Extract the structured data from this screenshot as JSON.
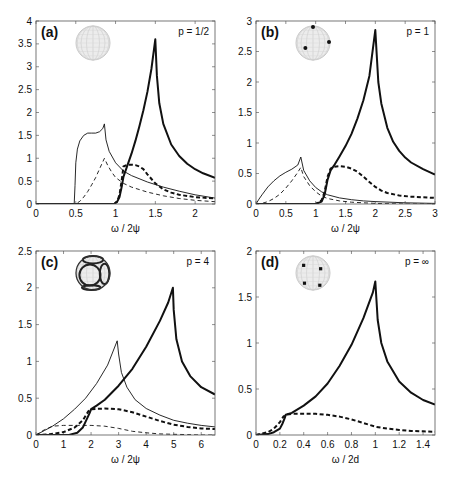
{
  "chart_data": [
    {
      "type": "line",
      "panel": "(a)",
      "annotation": "p = 1/2",
      "xlabel": "ω / 2ψ",
      "ylabel": "",
      "xlim": [
        0,
        2.25
      ],
      "ylim": [
        0,
        4
      ],
      "xticks": [
        0,
        0.5,
        1,
        1.5,
        2
      ],
      "xtick_labels": [
        "0",
        "0.5",
        "1",
        "1.5",
        "2"
      ],
      "yticks": [
        0,
        0.5,
        1,
        1.5,
        2,
        2.5,
        3,
        3.5,
        4
      ],
      "ytick_labels": [
        "0",
        "0.5",
        "1",
        "1.5",
        "2",
        "2.5",
        "3",
        "3.5",
        "4"
      ],
      "inset": "sphere-plain",
      "frame": {
        "x": 36,
        "y": 21,
        "w": 179,
        "h": 183
      },
      "series": [
        {
          "name": "thin-solid",
          "style": "thin-solid",
          "x": [
            0,
            0.48,
            0.49,
            0.5,
            0.52,
            0.55,
            0.6,
            0.65,
            0.7,
            0.75,
            0.8,
            0.84,
            0.86,
            0.88,
            0.92,
            1.0,
            1.1,
            1.2,
            1.4,
            1.6,
            1.8,
            2.0,
            2.25
          ],
          "y": [
            0,
            0,
            0.4,
            0.9,
            1.2,
            1.38,
            1.5,
            1.55,
            1.55,
            1.55,
            1.58,
            1.65,
            1.75,
            1.4,
            1.15,
            0.9,
            0.72,
            0.62,
            0.48,
            0.37,
            0.28,
            0.2,
            0.13
          ]
        },
        {
          "name": "thin-dashed",
          "style": "thin-dashed",
          "x": [
            0,
            0.5,
            0.55,
            0.6,
            0.65,
            0.7,
            0.75,
            0.8,
            0.86,
            0.9,
            0.95,
            1.0,
            1.1,
            1.2,
            1.4,
            1.6,
            1.8,
            2.0,
            2.25
          ],
          "y": [
            0,
            0,
            0.06,
            0.15,
            0.27,
            0.42,
            0.58,
            0.77,
            1.0,
            0.85,
            0.7,
            0.58,
            0.45,
            0.37,
            0.26,
            0.18,
            0.12,
            0.08,
            0.05
          ]
        },
        {
          "name": "thick-solid",
          "style": "thick-solid",
          "x": [
            0,
            0.98,
            1.02,
            1.05,
            1.08,
            1.1,
            1.15,
            1.2,
            1.25,
            1.3,
            1.35,
            1.4,
            1.45,
            1.5,
            1.52,
            1.55,
            1.6,
            1.7,
            1.8,
            1.9,
            2.0,
            2.1,
            2.25
          ],
          "y": [
            0,
            0,
            0.05,
            0.15,
            0.4,
            0.6,
            0.85,
            1.1,
            1.38,
            1.7,
            2.05,
            2.45,
            2.95,
            3.6,
            2.8,
            2.2,
            1.75,
            1.3,
            1.05,
            0.88,
            0.76,
            0.67,
            0.57
          ]
        },
        {
          "name": "thick-dashed",
          "style": "thick-dashed",
          "x": [
            0,
            0.98,
            1.02,
            1.05,
            1.08,
            1.1,
            1.15,
            1.2,
            1.25,
            1.3,
            1.35,
            1.4,
            1.5,
            1.6,
            1.7,
            1.8,
            2.0,
            2.25
          ],
          "y": [
            0,
            0,
            0.05,
            0.2,
            0.55,
            0.82,
            0.86,
            0.86,
            0.85,
            0.82,
            0.76,
            0.65,
            0.45,
            0.32,
            0.25,
            0.2,
            0.15,
            0.12
          ]
        }
      ]
    },
    {
      "type": "line",
      "panel": "(b)",
      "annotation": "p = 1",
      "xlabel": "ω / 2ψ",
      "ylabel": "",
      "xlim": [
        0,
        3
      ],
      "ylim": [
        0,
        3
      ],
      "xticks": [
        0,
        0.5,
        1,
        1.5,
        2,
        2.5,
        3
      ],
      "xtick_labels": [
        "0",
        "0.5",
        "1",
        "1.5",
        "2",
        "2.5",
        "3"
      ],
      "yticks": [
        0,
        0.5,
        1,
        1.5,
        2,
        2.5,
        3
      ],
      "ytick_labels": [
        "0",
        "0.5",
        "1",
        "1.5",
        "2",
        "2.5",
        "3"
      ],
      "inset": "sphere-3-dots",
      "frame": {
        "x": 256,
        "y": 21,
        "w": 179,
        "h": 183
      },
      "series": [
        {
          "name": "thin-solid",
          "style": "thin-solid",
          "x": [
            0,
            0.05,
            0.1,
            0.2,
            0.3,
            0.4,
            0.5,
            0.6,
            0.7,
            0.75,
            0.8,
            0.9,
            1.0,
            1.1,
            1.2,
            1.4,
            1.6,
            1.8,
            2.0,
            2.5,
            3.0
          ],
          "y": [
            0,
            0.08,
            0.15,
            0.28,
            0.38,
            0.46,
            0.52,
            0.57,
            0.64,
            0.77,
            0.55,
            0.38,
            0.27,
            0.2,
            0.15,
            0.1,
            0.07,
            0.05,
            0.04,
            0.02,
            0.01
          ]
        },
        {
          "name": "thin-dashed",
          "style": "thin-dashed",
          "x": [
            0,
            0.1,
            0.2,
            0.3,
            0.4,
            0.5,
            0.6,
            0.7,
            0.75,
            0.8,
            0.9,
            1.0,
            1.1,
            1.2,
            1.4,
            1.6,
            1.8,
            2.0,
            2.5,
            3.0
          ],
          "y": [
            0,
            0.01,
            0.04,
            0.09,
            0.16,
            0.26,
            0.38,
            0.52,
            0.6,
            0.45,
            0.3,
            0.2,
            0.13,
            0.09,
            0.05,
            0.03,
            0.02,
            0.01,
            0.0,
            0.0
          ]
        },
        {
          "name": "thick-solid",
          "style": "thick-solid",
          "x": [
            0,
            1.0,
            1.1,
            1.15,
            1.2,
            1.25,
            1.3,
            1.4,
            1.5,
            1.6,
            1.7,
            1.8,
            1.9,
            1.98,
            2.0,
            2.05,
            2.1,
            2.2,
            2.3,
            2.4,
            2.5,
            2.6,
            2.8,
            3.0
          ],
          "y": [
            0,
            0,
            0.04,
            0.15,
            0.4,
            0.55,
            0.62,
            0.78,
            0.95,
            1.15,
            1.4,
            1.7,
            2.1,
            2.7,
            2.85,
            2.0,
            1.65,
            1.25,
            1.02,
            0.87,
            0.76,
            0.68,
            0.57,
            0.48
          ]
        },
        {
          "name": "thick-dashed",
          "style": "thick-dashed",
          "x": [
            0,
            1.0,
            1.1,
            1.15,
            1.2,
            1.25,
            1.3,
            1.4,
            1.5,
            1.6,
            1.7,
            1.8,
            1.9,
            2.0,
            2.1,
            2.2,
            2.4,
            2.6,
            2.8,
            3.0
          ],
          "y": [
            0,
            0,
            0.06,
            0.2,
            0.45,
            0.58,
            0.61,
            0.62,
            0.61,
            0.58,
            0.53,
            0.45,
            0.36,
            0.28,
            0.22,
            0.18,
            0.14,
            0.12,
            0.11,
            0.1
          ]
        }
      ]
    },
    {
      "type": "line",
      "panel": "(c)",
      "annotation": "p = 4",
      "xlabel": "ω / 2ψ",
      "ylabel": "",
      "xlim": [
        0,
        6.5
      ],
      "ylim": [
        0,
        2.5
      ],
      "xticks": [
        0,
        1,
        2,
        3,
        4,
        5,
        6
      ],
      "xtick_labels": [
        "0",
        "1",
        "2",
        "3",
        "4",
        "5",
        "6"
      ],
      "yticks": [
        0,
        0.5,
        1,
        1.5,
        2,
        2.5
      ],
      "ytick_labels": [
        "0",
        "0.5",
        "1",
        "1.5",
        "2",
        "2.5"
      ],
      "inset": "sphere-loops",
      "frame": {
        "x": 36,
        "y": 251,
        "w": 179,
        "h": 184
      },
      "series": [
        {
          "name": "thin-solid",
          "style": "thin-solid",
          "x": [
            0,
            0.3,
            0.6,
            1.0,
            1.4,
            1.8,
            2.2,
            2.6,
            2.95,
            3.0,
            3.1,
            3.3,
            3.6,
            4.0,
            4.5,
            5.0,
            5.5,
            6.0,
            6.5
          ],
          "y": [
            0,
            0.06,
            0.12,
            0.22,
            0.35,
            0.5,
            0.7,
            0.95,
            1.28,
            1.1,
            0.85,
            0.65,
            0.48,
            0.36,
            0.27,
            0.2,
            0.16,
            0.13,
            0.11
          ]
        },
        {
          "name": "thin-dashed",
          "style": "thin-dashed",
          "x": [
            0,
            0.3,
            0.6,
            1.0,
            1.5,
            2.0,
            2.5,
            3.0,
            3.5,
            4.0,
            4.5,
            5.0,
            5.5,
            6.0,
            6.5
          ],
          "y": [
            0,
            0.07,
            0.12,
            0.13,
            0.13,
            0.13,
            0.12,
            0.09,
            0.05,
            0.03,
            0.015,
            0.01,
            0.005,
            0.0,
            0.0
          ]
        },
        {
          "name": "thick-solid",
          "style": "thick-solid",
          "x": [
            0,
            1.2,
            1.5,
            1.7,
            1.85,
            1.95,
            2.0,
            2.2,
            2.5,
            3.0,
            3.5,
            4.0,
            4.5,
            4.8,
            4.97,
            5.0,
            5.1,
            5.3,
            5.6,
            6.0,
            6.5
          ],
          "y": [
            0,
            0,
            0.03,
            0.1,
            0.22,
            0.3,
            0.35,
            0.4,
            0.48,
            0.67,
            0.9,
            1.2,
            1.55,
            1.8,
            2.0,
            1.7,
            1.3,
            1.0,
            0.8,
            0.65,
            0.55
          ]
        },
        {
          "name": "thick-dashed",
          "style": "thick-dashed",
          "x": [
            0,
            0.5,
            1.0,
            1.4,
            1.7,
            1.9,
            2.0,
            2.5,
            3.0,
            3.5,
            4.0,
            4.5,
            5.0,
            5.5,
            6.0,
            6.5
          ],
          "y": [
            0,
            0.01,
            0.04,
            0.1,
            0.2,
            0.32,
            0.35,
            0.36,
            0.35,
            0.31,
            0.25,
            0.19,
            0.14,
            0.11,
            0.09,
            0.08
          ]
        }
      ]
    },
    {
      "type": "line",
      "panel": "(d)",
      "annotation": "p = ∞",
      "xlabel": "ω / 2d",
      "ylabel": "",
      "xlim": [
        0,
        1.5
      ],
      "ylim": [
        0,
        2
      ],
      "xticks": [
        0,
        0.2,
        0.4,
        0.6,
        0.8,
        1,
        1.2,
        1.4
      ],
      "xtick_labels": [
        "0",
        "0.2",
        "0.4",
        "0.6",
        "0.8",
        "1",
        "1.2",
        "1.4"
      ],
      "yticks": [
        0,
        0.5,
        1,
        1.5,
        2
      ],
      "ytick_labels": [
        "0",
        "0.5",
        "1",
        "1.5",
        "2"
      ],
      "inset": "sphere-4-dots",
      "frame": {
        "x": 256,
        "y": 251,
        "w": 179,
        "h": 184
      },
      "series": [
        {
          "name": "thick-solid",
          "style": "thick-solid",
          "x": [
            0,
            0.1,
            0.15,
            0.2,
            0.22,
            0.24,
            0.25,
            0.3,
            0.4,
            0.5,
            0.6,
            0.7,
            0.8,
            0.9,
            0.98,
            1.0,
            1.02,
            1.05,
            1.1,
            1.2,
            1.3,
            1.4,
            1.5
          ],
          "y": [
            0,
            0.01,
            0.03,
            0.07,
            0.12,
            0.18,
            0.22,
            0.24,
            0.32,
            0.42,
            0.56,
            0.75,
            0.98,
            1.27,
            1.55,
            1.67,
            1.25,
            1.0,
            0.8,
            0.58,
            0.46,
            0.38,
            0.33
          ]
        },
        {
          "name": "thick-dashed",
          "style": "thick-dashed",
          "x": [
            0,
            0.1,
            0.15,
            0.2,
            0.23,
            0.25,
            0.3,
            0.4,
            0.5,
            0.6,
            0.7,
            0.8,
            0.9,
            1.0,
            1.1,
            1.2,
            1.3,
            1.4,
            1.5
          ],
          "y": [
            0,
            0.03,
            0.07,
            0.14,
            0.2,
            0.22,
            0.23,
            0.23,
            0.23,
            0.22,
            0.2,
            0.17,
            0.13,
            0.09,
            0.07,
            0.055,
            0.045,
            0.04,
            0.035
          ]
        }
      ]
    }
  ]
}
